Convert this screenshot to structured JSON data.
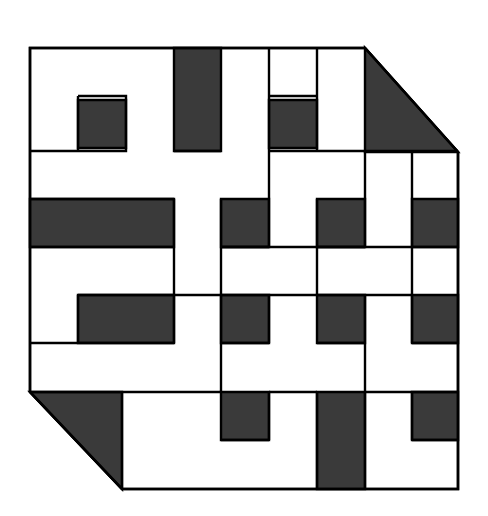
{
  "figure": {
    "kind": "geometric-knot-figure",
    "canvas": {
      "width": 488,
      "height": 516
    },
    "colors": {
      "background": "#ffffff",
      "fill_dark": "#3a3a3a",
      "fill_light": "#ffffff",
      "stroke": "#000000"
    },
    "stroke_width": 2.4,
    "grid": {
      "columns": [
        30,
        78,
        126,
        174,
        221,
        269,
        317,
        365,
        412,
        458
      ],
      "rows": [
        48,
        96,
        151,
        199,
        247,
        295,
        343,
        392,
        440,
        489
      ],
      "cell_size": 48
    },
    "outline": {
      "description": "Square with the top-right and bottom-left corners cut by a 45 degree diagonal",
      "points": "30,48 365,48 458,152 458,489 122,489 30,392"
    },
    "dark_shapes": [
      {
        "name": "corner-triangle-top-right",
        "points": "365,48 458,152 365,152"
      },
      {
        "name": "corner-triangle-bottom-left",
        "points": "30,392 122,489 122,392"
      },
      {
        "name": "band-top-vertical",
        "points": "174,48 221,48 221,151 174,151"
      },
      {
        "name": "square-top-left-inner",
        "points": "78,100 126,100 126,148 78,148"
      },
      {
        "name": "square-top-right-inner",
        "points": "269,100 317,100 317,148 269,148"
      },
      {
        "name": "bar-left-upper",
        "points": "30,199 174,199 174,247 30,247"
      },
      {
        "name": "bar-mid-upper-left",
        "points": "221,199 269,199 269,247 221,247"
      },
      {
        "name": "bar-mid-upper-right",
        "points": "317,199 365,199 365,247 317,247"
      },
      {
        "name": "bar-right-upper",
        "points": "412,199 458,199 458,247 412,247"
      },
      {
        "name": "square-mid-left",
        "points": "78,295 174,295 174,343 78,343"
      },
      {
        "name": "square-mid-center-left",
        "points": "221,295 269,295 269,343 221,343"
      },
      {
        "name": "square-mid-center-right",
        "points": "317,295 365,295 365,343 317,343"
      },
      {
        "name": "bar-right-lower",
        "points": "412,295 458,295 458,343 412,343"
      },
      {
        "name": "square-bottom-left-inner",
        "points": "221,392 269,392 269,440 221,440"
      },
      {
        "name": "band-bottom-vertical",
        "points": "317,392 365,392 365,489 317,489"
      },
      {
        "name": "square-bottom-right-inner",
        "points": "412,392 458,392 458,440 412,440"
      }
    ],
    "strands": {
      "count": 2,
      "weave": "over-under interlace"
    }
  }
}
